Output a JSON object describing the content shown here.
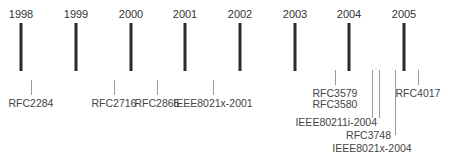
{
  "diagram": {
    "type": "timeline",
    "years": [
      {
        "label": "1998",
        "x": 21
      },
      {
        "label": "1999",
        "x": 76
      },
      {
        "label": "2000",
        "x": 131
      },
      {
        "label": "2001",
        "x": 185
      },
      {
        "label": "2002",
        "x": 240
      },
      {
        "label": "2003",
        "x": 295
      },
      {
        "label": "2004",
        "x": 349
      },
      {
        "label": "2005",
        "x": 404
      }
    ],
    "events": [
      {
        "label": "RFC2284",
        "x": 31
      },
      {
        "label": "RFC2716",
        "x": 114
      },
      {
        "label": "RFC2865",
        "x": 157
      },
      {
        "label": "IEEE8021x-2001",
        "x": 213
      },
      {
        "label": "RFC3579",
        "x": 335
      },
      {
        "label": "RFC3580",
        "x": 335
      },
      {
        "label": "IEEE80211i-2004",
        "x": 372
      },
      {
        "label": "RFC3748",
        "x": 379
      },
      {
        "label": "IEEE8021x-2004",
        "x": 395
      },
      {
        "label": "RFC4017",
        "x": 418
      }
    ]
  }
}
